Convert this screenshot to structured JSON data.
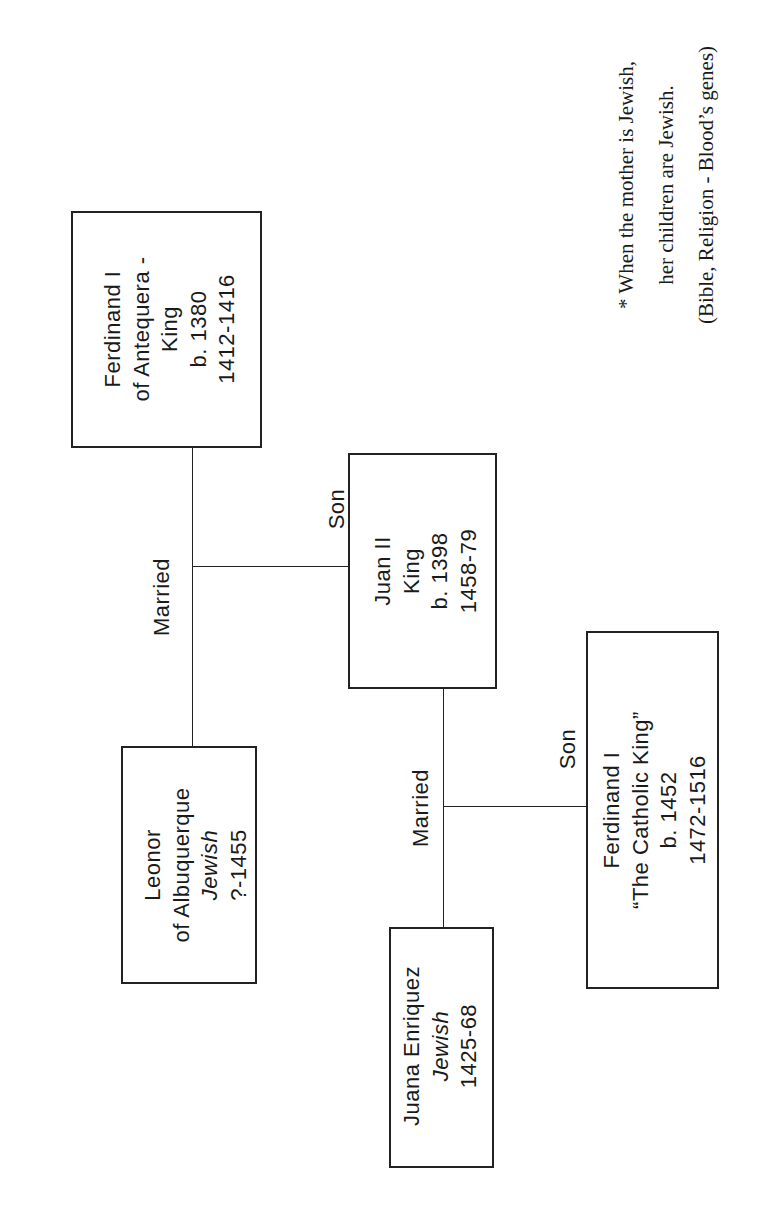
{
  "diagram": {
    "type": "family-tree",
    "orientation": "rotated-90-ccw",
    "line_color": "#222222",
    "people": {
      "ferdinand_antequera": {
        "lines": [
          "Ferdinand I",
          "of Antequera -",
          "King",
          "b. 1380",
          "1412-1416"
        ]
      },
      "leonor": {
        "lines": [
          "Leonor",
          "of Albuquerque",
          "Jewish",
          "?-1455"
        ],
        "italic_line_index": 2
      },
      "juan_ii": {
        "lines": [
          "Juan II",
          "King",
          "b. 1398",
          "1458-79"
        ]
      },
      "juana_enriquez": {
        "lines": [
          "Juana Enriquez",
          "Jewish",
          "1425-68"
        ],
        "italic_line_index": 1
      },
      "ferdinand_catholic": {
        "lines": [
          "Ferdinand I",
          "“The Catholic King”",
          "b. 1452",
          "1472-1516"
        ]
      }
    },
    "relations": {
      "married_1": "Married",
      "son_1": "Son",
      "married_2": "Married",
      "son_2": "Son"
    },
    "note": {
      "lines": [
        "* When the mother is Jewish,",
        "her children are Jewish.",
        "(Bible, Religion - Blood’s genes)"
      ]
    }
  }
}
